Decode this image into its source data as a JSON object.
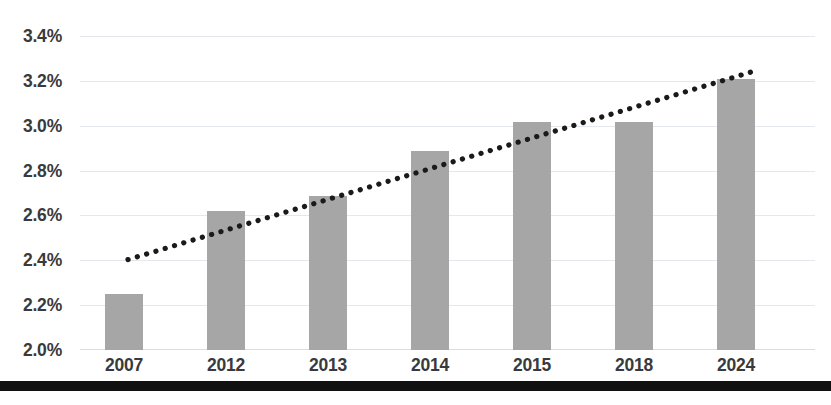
{
  "chart_data": {
    "type": "bar",
    "title": "",
    "subtitle": "",
    "xlabel": "",
    "ylabel": "",
    "categories": [
      "2007",
      "2012",
      "2013",
      "2014",
      "2015",
      "2018",
      "2024"
    ],
    "values": [
      2.25,
      2.62,
      2.69,
      2.89,
      3.02,
      3.02,
      3.21
    ],
    "value_format": "percent",
    "ylim": [
      2.0,
      3.4
    ],
    "ytick_step": 0.2,
    "ytick_labels": [
      "3.4%",
      "3.2%",
      "3.0%",
      "2.8%",
      "2.6%",
      "2.4%",
      "2.2%",
      "2.0%"
    ],
    "ytick_values": [
      3.4,
      3.2,
      3.0,
      2.8,
      2.6,
      2.4,
      2.2,
      2.0
    ],
    "grid": true,
    "grid_axis": "y",
    "legend": false,
    "legend_position": "none",
    "bar_color": "#a6a6a6",
    "grid_color": "#e4e8ec",
    "text_color": "#3a3a3a",
    "series": [
      {
        "name": "",
        "values": [
          2.25,
          2.62,
          2.69,
          2.89,
          3.02,
          3.02,
          3.21
        ]
      }
    ],
    "annotations": [
      {
        "type": "trendline",
        "style": "dotted",
        "color": "#1a1a1a",
        "start_value": 2.4,
        "end_value": 3.24,
        "start_category": "2007",
        "end_category": "2024"
      }
    ]
  },
  "decorations": {
    "bottom_rule_color": "#111111"
  }
}
